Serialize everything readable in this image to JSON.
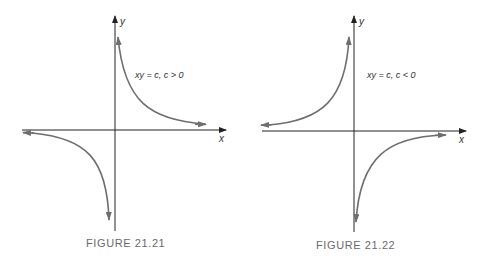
{
  "figures": [
    {
      "caption": "FIGURE 21.21",
      "equation": "xy = c, c > 0",
      "x_label": "x",
      "y_label": "y",
      "branches": [
        "quadrant I",
        "quadrant III"
      ]
    },
    {
      "caption": "FIGURE 21.22",
      "equation": "xy = c, c < 0",
      "x_label": "x",
      "y_label": "y",
      "branches": [
        "quadrant II",
        "quadrant IV"
      ]
    }
  ],
  "colors": {
    "axis": "#222222",
    "curve": "#6e6e6e",
    "caption": "#6a6a6a"
  }
}
